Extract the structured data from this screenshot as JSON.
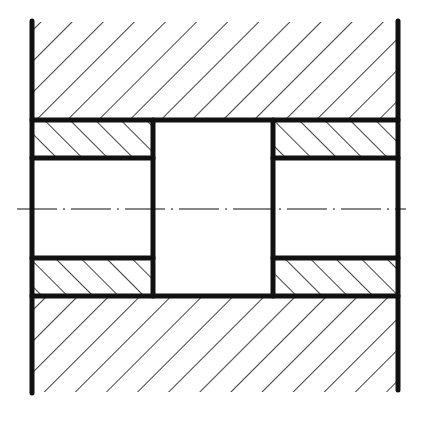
{
  "diagram": {
    "type": "engineering-section-drawing",
    "colors": {
      "line": "#111111",
      "background": "#ffffff"
    },
    "centerline": {
      "style": "dash-dot"
    },
    "regions": [
      {
        "name": "upper-housing",
        "hatch": "forward-slash"
      },
      {
        "name": "upper-left-bushing",
        "hatch": "back-slash"
      },
      {
        "name": "upper-right-bushing",
        "hatch": "back-slash"
      },
      {
        "name": "central-bore",
        "hatch": "none"
      },
      {
        "name": "lower-left-bushing",
        "hatch": "back-slash"
      },
      {
        "name": "lower-right-bushing",
        "hatch": "back-slash"
      },
      {
        "name": "lower-housing",
        "hatch": "forward-slash"
      }
    ]
  }
}
